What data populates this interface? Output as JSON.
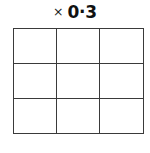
{
  "figure": {
    "kind": "multiplication-grid-worksheet",
    "background_color": "#ffffff"
  },
  "label": {
    "operator": "×",
    "value": "0·3",
    "full_text": "× 0·3",
    "color": "#111111"
  },
  "grid": {
    "rows": 3,
    "columns": 3,
    "line_color": "#3a3a3a",
    "cell_fill": "#ffffff",
    "cells": [
      [
        "",
        "",
        ""
      ],
      [
        "",
        "",
        ""
      ],
      [
        "",
        "",
        ""
      ]
    ]
  }
}
